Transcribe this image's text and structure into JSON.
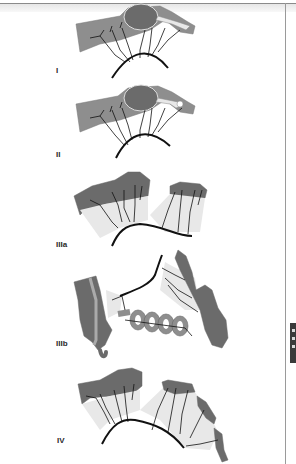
{
  "figure": {
    "panels": [
      {
        "id": "I",
        "label": "I"
      },
      {
        "id": "II",
        "label": "II"
      },
      {
        "id": "IIIa",
        "label": "IIIa"
      },
      {
        "id": "IIIb",
        "label": "IIIb"
      },
      {
        "id": "IV",
        "label": "IV"
      }
    ]
  },
  "colors": {
    "organ_dark": "#6b6b6b",
    "organ_mid": "#8e8e8e",
    "mesentery": "#e6e6e6",
    "vessel": "#111111",
    "background": "#ffffff"
  },
  "page_edge_tab": {
    "icon": "page-edge-tab"
  }
}
